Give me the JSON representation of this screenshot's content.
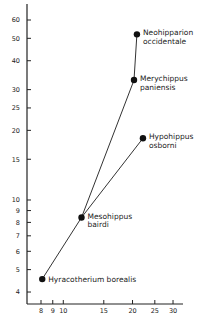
{
  "chart_data": {
    "type": "line",
    "title": "",
    "xlabel": "",
    "ylabel": "",
    "x_scale": "log",
    "y_scale": "log",
    "xlim": [
      7.5,
      35
    ],
    "ylim": [
      3.6,
      70
    ],
    "grid": false,
    "x_ticks": [
      8,
      9,
      10,
      15,
      20,
      25,
      30
    ],
    "y_ticks": [
      4,
      5,
      6,
      7,
      8,
      9,
      10,
      15,
      20,
      25,
      30,
      40,
      50,
      60
    ],
    "points": [
      {
        "id": "hyracotherium",
        "name": "Hyracotherium borealis",
        "label_lines": [
          "Hyracotherium borealis"
        ],
        "x": 8.1,
        "y": 4.55
      },
      {
        "id": "mesohippus",
        "name": "Mesohippus bairdi",
        "label_lines": [
          "Mesohippus",
          "bairdi"
        ],
        "x": 12.0,
        "y": 8.4
      },
      {
        "id": "merychippus",
        "name": "Merychippus paniensis",
        "label_lines": [
          "Merychippus",
          "paniensis"
        ],
        "x": 20.3,
        "y": 33
      },
      {
        "id": "neohipparion",
        "name": "Neohipparion occidentale",
        "label_lines": [
          "Neohipparion",
          "occidentale"
        ],
        "x": 20.9,
        "y": 52
      },
      {
        "id": "hypohippus",
        "name": "Hypohippus osborni",
        "label_lines": [
          "Hypohippus",
          "osborni"
        ],
        "x": 22.2,
        "y": 18.5
      }
    ],
    "series": [
      {
        "name": "Hyracotherium to Neohipparion lineage",
        "points": [
          "hyracotherium",
          "mesohippus",
          "merychippus",
          "neohipparion"
        ]
      },
      {
        "name": "Mesohippus to Hypohippus branch",
        "points": [
          "mesohippus",
          "hypohippus"
        ]
      }
    ]
  }
}
